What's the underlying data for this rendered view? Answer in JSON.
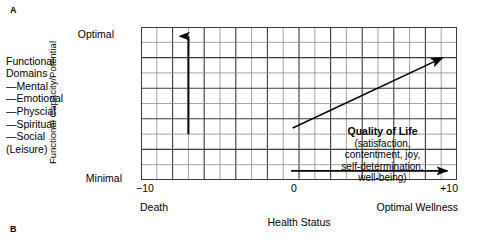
{
  "panels": {
    "a_label": "A",
    "b_label": "B"
  },
  "legend": {
    "optimal": "Optimal",
    "minimal": "Minimal",
    "heading_line1": "Functional",
    "heading_line2": "Domains",
    "items": [
      "—Mental",
      "—Emotional",
      "—Physcial",
      "—Spiritual",
      "—Social"
    ],
    "sub_note": "(Leisure)"
  },
  "axes": {
    "y_title": "Functional Capacity/Potential",
    "x_title": "Health Status",
    "x_ticks": {
      "min": "−10",
      "mid": "0",
      "max": "+10"
    },
    "x_endcaps": {
      "left": "Death",
      "right": "Optimal Wellness"
    }
  },
  "callout": {
    "title": "Quality of Life",
    "body": "(satisfaction,\ncontentment, joy,\nself-determination,\nwell-being)"
  },
  "colors": {
    "ink": "#000000",
    "grid_minor": "#8c8c8c",
    "grid_major": "#3a3a3a",
    "background": "#ffffff"
  },
  "chart_data": {
    "type": "diagram",
    "xlabel": "Health Status",
    "ylabel": "Functional Capacity/Potential",
    "xlim": [
      -10,
      10
    ],
    "ylim": [
      "Minimal",
      "Optimal"
    ],
    "grid": true,
    "grid_columns": 20,
    "grid_rows": 10,
    "arrows": [
      {
        "name": "vertical-functional-capacity-arrow",
        "direction": "up",
        "x_data": -7,
        "y_from_row": 7,
        "y_to_row": 0.6
      },
      {
        "name": "diagonal-quality-of-life-arrow",
        "direction": "up-right",
        "from": {
          "x_data": -0.4,
          "y_row": 6.6
        },
        "to": {
          "x_data": 9.1,
          "y_row": 2.0
        }
      },
      {
        "name": "horizontal-health-status-arrow",
        "direction": "right",
        "from": {
          "x_data": -0.5,
          "y_row": 9.4
        },
        "to": {
          "x_data": 9.4,
          "y_row": 9.4
        }
      }
    ]
  }
}
